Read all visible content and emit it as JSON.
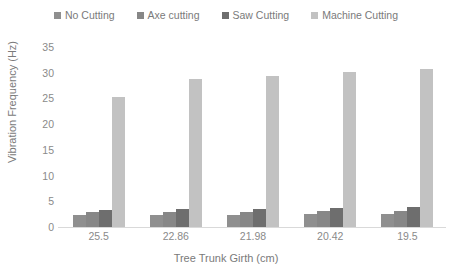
{
  "chart_data": {
    "type": "bar",
    "title": "",
    "xlabel": "Tree Trunk Girth (cm)",
    "ylabel": "Vibration Frequency (Hz)",
    "categories": [
      "25.5",
      "22.86",
      "21.98",
      "20.42",
      "19.5"
    ],
    "yticks": [
      "0",
      "5",
      "10",
      "15",
      "20",
      "25",
      "30",
      "35"
    ],
    "ylim": [
      0,
      35
    ],
    "grid": false,
    "legend_position": "top-center",
    "series": [
      {
        "name": "No Cutting",
        "color": "#8f8f8f",
        "values": [
          2.3,
          2.4,
          2.4,
          2.5,
          2.6
        ]
      },
      {
        "name": "Axe cutting",
        "color": "#878787",
        "values": [
          2.9,
          3.0,
          3.0,
          3.1,
          3.2
        ]
      },
      {
        "name": "Saw Cutting",
        "color": "#6e6e6e",
        "values": [
          3.3,
          3.5,
          3.5,
          3.7,
          3.8
        ]
      },
      {
        "name": "Machine Cutting",
        "color": "#c2c2c2",
        "values": [
          25.2,
          28.7,
          29.3,
          30.1,
          30.8
        ]
      }
    ]
  }
}
